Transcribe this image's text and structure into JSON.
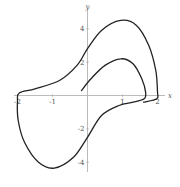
{
  "chart_data": {
    "type": "line",
    "title": "",
    "xlabel": "x",
    "ylabel": "y",
    "xlim": [
      -2.1,
      2.1
    ],
    "ylim": [
      -4.7,
      4.8
    ],
    "grid": false,
    "x_ticks": [
      -2,
      -1,
      1,
      2
    ],
    "x_tick_labels": [
      "-2",
      "-1",
      "1",
      "2"
    ],
    "y_ticks": [
      -4,
      -2,
      2,
      4
    ],
    "y_tick_labels": [
      "-4",
      "-2",
      "2",
      "4"
    ],
    "series": [
      {
        "name": "trajectory",
        "color": "#222222",
        "points": [
          [
            -0.17,
            0.3
          ],
          [
            0.1,
            1.0
          ],
          [
            0.5,
            1.8
          ],
          [
            0.95,
            2.2
          ],
          [
            1.3,
            1.9
          ],
          [
            1.55,
            1.0
          ],
          [
            1.66,
            0.2
          ],
          [
            1.62,
            -0.2
          ],
          [
            1.3,
            -0.4
          ],
          [
            0.9,
            -0.6
          ],
          [
            0.4,
            -1.2
          ],
          [
            0.0,
            -2.5
          ],
          [
            -0.4,
            -3.7
          ],
          [
            -0.95,
            -4.35
          ],
          [
            -1.4,
            -4.0
          ],
          [
            -1.8,
            -2.8
          ],
          [
            -1.98,
            -1.5
          ],
          [
            -2.0,
            -0.3
          ],
          [
            -1.95,
            0.15
          ],
          [
            -1.5,
            0.4
          ],
          [
            -0.8,
            0.9
          ],
          [
            -0.3,
            1.8
          ],
          [
            0.0,
            2.8
          ],
          [
            0.4,
            3.9
          ],
          [
            0.95,
            4.5
          ],
          [
            1.4,
            4.2
          ],
          [
            1.75,
            3.0
          ],
          [
            1.95,
            1.5
          ],
          [
            2.0,
            0.2
          ],
          [
            1.98,
            -0.2
          ],
          [
            1.6,
            -0.4
          ]
        ]
      }
    ]
  }
}
